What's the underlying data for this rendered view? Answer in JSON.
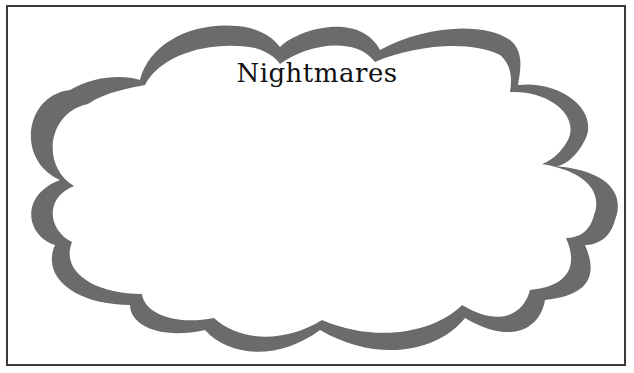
{
  "card": {
    "title": "Nightmares",
    "border_color": "#3a3a3a",
    "cloud_outline_color": "#6b6b6b",
    "background_color": "#ffffff"
  }
}
